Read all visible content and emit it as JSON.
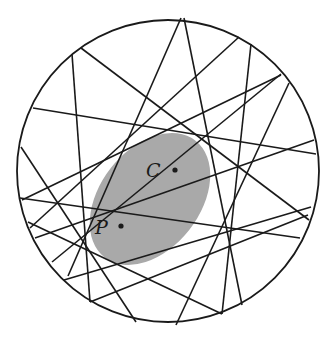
{
  "figure": {
    "background": "#ffffff",
    "stroke_color": "#1a1a1a",
    "circle": {
      "cx": 168,
      "cy": 171,
      "r": 151
    },
    "ellipse": {
      "cx": 150,
      "cy": 199,
      "rx": 74,
      "ry": 50,
      "rotation": -52,
      "fill": "#a9a9a9"
    },
    "points": [
      {
        "name": "C",
        "label": "C",
        "x": 175,
        "y": 170,
        "label_x": 146,
        "label_y": 177
      },
      {
        "name": "P",
        "label": "P",
        "x": 121,
        "y": 226,
        "label_x": 95,
        "label_y": 234
      }
    ],
    "chords": [
      [
        181,
        18,
        68,
        276
      ],
      [
        184,
        18,
        242,
        305
      ],
      [
        81,
        48,
        309,
        220
      ],
      [
        72,
        54,
        90,
        302
      ],
      [
        33,
        108,
        316,
        154
      ],
      [
        21,
        147,
        136,
        322
      ],
      [
        22,
        200,
        281,
        75
      ],
      [
        239,
        37,
        30,
        228
      ],
      [
        251,
        44,
        222,
        314
      ],
      [
        281,
        74,
        52,
        262
      ],
      [
        289,
        83,
        176,
        325
      ],
      [
        314,
        140,
        35,
        238
      ],
      [
        311,
        207,
        64,
        280
      ],
      [
        308,
        215,
        90,
        302
      ],
      [
        20,
        198,
        300,
        238
      ],
      [
        28,
        222,
        222,
        314
      ]
    ]
  }
}
